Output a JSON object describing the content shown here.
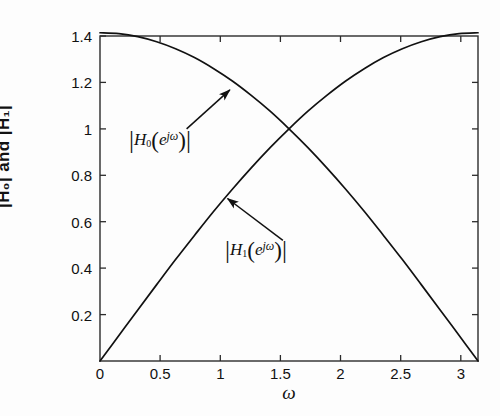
{
  "chart_data": {
    "type": "line",
    "title": "",
    "xlabel": "ω",
    "ylabel": "|H0| and |H1|",
    "xlim": [
      0,
      3.14159
    ],
    "ylim": [
      0,
      1.4
    ],
    "xticks": [
      0,
      0.5,
      1,
      1.5,
      2,
      2.5,
      3
    ],
    "xtick_labels": [
      "0",
      "0.5",
      "1",
      "1.5",
      "2",
      "2.5",
      "3"
    ],
    "yticks": [
      0,
      0.2,
      0.4,
      0.6,
      0.8,
      1,
      1.2,
      1.4
    ],
    "ytick_labels": [
      "",
      "0.2",
      "0.4",
      "0.6",
      "0.8",
      "1",
      "1.2",
      "1.4"
    ],
    "grid": false,
    "legend": "none",
    "line_color": "#111111",
    "line_width": 1.6,
    "series": [
      {
        "name": "|H0(e^jw)|",
        "formula": "sqrt(2)*cos(w/2)",
        "x": [
          0,
          0.157,
          0.314,
          0.471,
          0.628,
          0.785,
          0.942,
          1.1,
          1.257,
          1.414,
          1.571,
          1.728,
          1.885,
          2.042,
          2.199,
          2.356,
          2.513,
          2.67,
          2.827,
          2.985,
          3.142
        ],
        "values": [
          1.414,
          1.41,
          1.397,
          1.375,
          1.345,
          1.307,
          1.26,
          1.206,
          1.144,
          1.076,
          1.0,
          0.919,
          0.832,
          0.74,
          0.643,
          0.541,
          0.437,
          0.329,
          0.22,
          0.11,
          0.0
        ]
      },
      {
        "name": "|H1(e^jw)|",
        "formula": "sqrt(2)*sin(w/2)",
        "x": [
          0,
          0.157,
          0.314,
          0.471,
          0.628,
          0.785,
          0.942,
          1.1,
          1.257,
          1.414,
          1.571,
          1.728,
          1.885,
          2.042,
          2.199,
          2.356,
          2.513,
          2.67,
          2.827,
          2.985,
          3.142
        ],
        "values": [
          0.0,
          0.11,
          0.22,
          0.329,
          0.437,
          0.541,
          0.643,
          0.74,
          0.832,
          0.919,
          1.0,
          1.076,
          1.144,
          1.206,
          1.26,
          1.307,
          1.345,
          1.375,
          1.397,
          1.41,
          1.414
        ]
      }
    ],
    "annotations": [
      {
        "id": "h0",
        "text": "|H0(ejw)|",
        "parts": {
          "fn": "H",
          "sub": "0",
          "exp": "jω",
          "base": "e"
        },
        "label_x": 0.72,
        "label_y": 1.0,
        "arrow_to_x": 1.08,
        "arrow_to_y": 1.168
      },
      {
        "id": "h1",
        "text": "|H1(ejw)|",
        "parts": {
          "fn": "H",
          "sub": "1",
          "exp": "jω",
          "base": "e"
        },
        "label_x": 1.52,
        "label_y": 0.52,
        "arrow_to_x": 1.06,
        "arrow_to_y": 0.7
      }
    ]
  },
  "axis": {
    "ylabel": "|H₀| and |H₁|",
    "xlabel": "ω",
    "ytick_0_2": "0.2",
    "ytick_0_4": "0.4",
    "ytick_0_6": "0.6",
    "ytick_0_8": "0.8",
    "ytick_1": "1",
    "ytick_1_2": "1.2",
    "ytick_1_4": "1.4",
    "xtick_0": "0",
    "xtick_0_5": "0.5",
    "xtick_1": "1",
    "xtick_1_5": "1.5",
    "xtick_2": "2",
    "xtick_2_5": "2.5",
    "xtick_3": "3"
  },
  "annotations": {
    "h0": {
      "fn": "H",
      "sub": "0",
      "base": "e",
      "exp": "jω"
    },
    "h1": {
      "fn": "H",
      "sub": "1",
      "base": "e",
      "exp": "jω"
    }
  }
}
